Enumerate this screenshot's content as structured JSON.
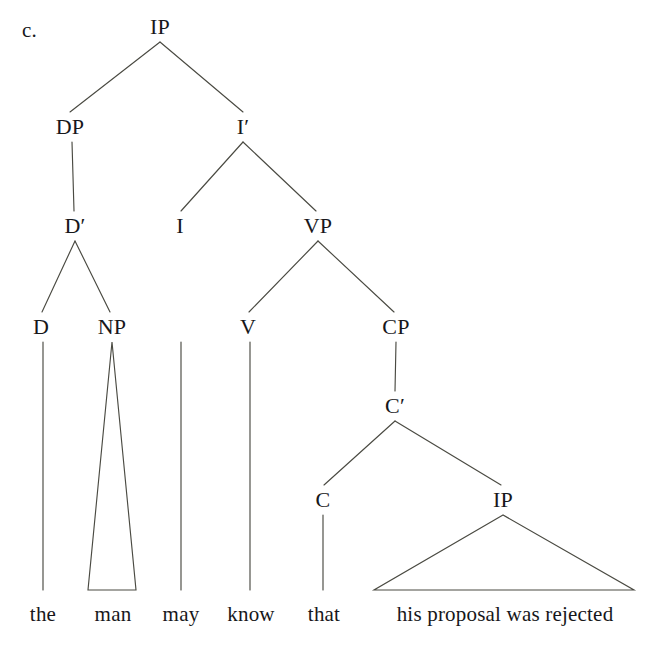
{
  "figure": {
    "example_letter": "c.",
    "sentence": "the man may know that his proposal was rejected",
    "diagram_type": "x-bar syntax tree",
    "line_color": "#4a4a42",
    "text_color": "#17171a",
    "background_color": "#ffffff"
  },
  "nodes": [
    {
      "id": "IP-root",
      "label": "IP",
      "x": 160,
      "y": 27
    },
    {
      "id": "DP",
      "label": "DP",
      "x": 70,
      "y": 127
    },
    {
      "id": "I-bar",
      "label": "I′",
      "x": 243,
      "y": 127
    },
    {
      "id": "D-bar",
      "label": "D′",
      "x": 75,
      "y": 226
    },
    {
      "id": "I",
      "label": "I",
      "x": 180,
      "y": 226
    },
    {
      "id": "VP",
      "label": "VP",
      "x": 318,
      "y": 226
    },
    {
      "id": "D",
      "label": "D",
      "x": 41,
      "y": 327
    },
    {
      "id": "NP",
      "label": "NP",
      "x": 112,
      "y": 327
    },
    {
      "id": "V",
      "label": "V",
      "x": 248,
      "y": 327
    },
    {
      "id": "CP",
      "label": "CP",
      "x": 396,
      "y": 327
    },
    {
      "id": "C-bar",
      "label": "C′",
      "x": 395,
      "y": 406
    },
    {
      "id": "C",
      "label": "C",
      "x": 323,
      "y": 500
    },
    {
      "id": "IP-embed",
      "label": "IP",
      "x": 503,
      "y": 500
    }
  ],
  "edges": [
    {
      "id": "ip-dp",
      "from": "IP-root",
      "to": "DP",
      "x1": 160,
      "y1": 42,
      "x2": 70,
      "y2": 112
    },
    {
      "id": "ip-ibar",
      "from": "IP-root",
      "to": "I-bar",
      "x1": 160,
      "y1": 42,
      "x2": 243,
      "y2": 112
    },
    {
      "id": "dp-dbar",
      "from": "DP",
      "to": "D-bar",
      "x1": 72,
      "y1": 142,
      "x2": 74,
      "y2": 211
    },
    {
      "id": "ibar-i",
      "from": "I-bar",
      "to": "I",
      "x1": 243,
      "y1": 142,
      "x2": 181,
      "y2": 211
    },
    {
      "id": "ibar-vp",
      "from": "I-bar",
      "to": "VP",
      "x1": 243,
      "y1": 142,
      "x2": 316,
      "y2": 211
    },
    {
      "id": "dbar-d",
      "from": "D-bar",
      "to": "D",
      "x1": 75,
      "y1": 241,
      "x2": 42,
      "y2": 312
    },
    {
      "id": "dbar-np",
      "from": "D-bar",
      "to": "NP",
      "x1": 75,
      "y1": 241,
      "x2": 110,
      "y2": 312
    },
    {
      "id": "vp-v",
      "from": "VP",
      "to": "V",
      "x1": 318,
      "y1": 241,
      "x2": 249,
      "y2": 312
    },
    {
      "id": "vp-cp",
      "from": "VP",
      "to": "CP",
      "x1": 318,
      "y1": 241,
      "x2": 394,
      "y2": 312
    },
    {
      "id": "cp-cbar",
      "from": "CP",
      "to": "C-bar",
      "x1": 396,
      "y1": 342,
      "x2": 395,
      "y2": 391
    },
    {
      "id": "cbar-c",
      "from": "C-bar",
      "to": "C",
      "x1": 395,
      "y1": 421,
      "x2": 324,
      "y2": 485
    },
    {
      "id": "cbar-ip",
      "from": "C-bar",
      "to": "IP-embed",
      "x1": 395,
      "y1": 421,
      "x2": 501,
      "y2": 485
    },
    {
      "id": "d-the",
      "from": "D",
      "to": "the",
      "x1": 43,
      "y1": 342,
      "x2": 43,
      "y2": 590
    },
    {
      "id": "i-may",
      "from": "I",
      "to": "may",
      "x1": 181,
      "y1": 342,
      "x2": 181,
      "y2": 590
    },
    {
      "id": "v-know",
      "from": "V",
      "to": "know",
      "x1": 250,
      "y1": 342,
      "x2": 250,
      "y2": 590
    },
    {
      "id": "c-that",
      "from": "C",
      "to": "that",
      "x1": 323,
      "y1": 515,
      "x2": 323,
      "y2": 590
    }
  ],
  "triangles": [
    {
      "id": "np-triangle",
      "over": "NP",
      "dominates": "man",
      "apex_x": 112,
      "apex_y": 342,
      "left_x": 88,
      "right_x": 136,
      "base_y": 590
    },
    {
      "id": "ip-triangle",
      "over": "IP-embed",
      "dominates": "his proposal was rejected",
      "apex_x": 503,
      "apex_y": 515,
      "left_x": 374,
      "right_x": 634,
      "base_y": 590
    }
  ],
  "words": [
    {
      "id": "word-the",
      "text": "the",
      "x": 43,
      "y": 614
    },
    {
      "id": "word-man",
      "text": "man",
      "x": 113,
      "y": 614
    },
    {
      "id": "word-may",
      "text": "may",
      "x": 181,
      "y": 614
    },
    {
      "id": "word-know",
      "text": "know",
      "x": 251,
      "y": 614
    },
    {
      "id": "word-that",
      "text": "that",
      "x": 324,
      "y": 614
    },
    {
      "id": "word-embedded",
      "text": "his proposal was rejected",
      "x": 505,
      "y": 614
    }
  ]
}
